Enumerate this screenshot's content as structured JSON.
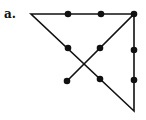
{
  "figure": {
    "label": "a.",
    "colors": {
      "line": "#111111",
      "dot": "#111111",
      "background": "#ffffff"
    }
  },
  "dots": [
    {
      "x": 68,
      "y": 14
    },
    {
      "x": 101,
      "y": 14
    },
    {
      "x": 134,
      "y": 14
    },
    {
      "x": 68,
      "y": 48
    },
    {
      "x": 100,
      "y": 48
    },
    {
      "x": 134,
      "y": 50
    },
    {
      "x": 67,
      "y": 81
    },
    {
      "x": 100,
      "y": 79
    },
    {
      "x": 134,
      "y": 80
    }
  ],
  "path": [
    {
      "x": 67,
      "y": 81
    },
    {
      "x": 134,
      "y": 14
    },
    {
      "x": 31,
      "y": 14
    },
    {
      "x": 134,
      "y": 111
    },
    {
      "x": 134,
      "y": 14
    }
  ]
}
